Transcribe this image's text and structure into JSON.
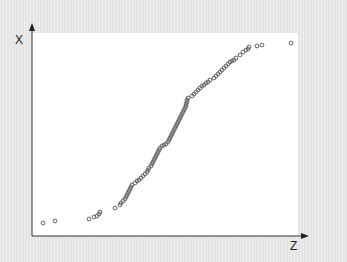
{
  "chart_data": {
    "type": "scatter",
    "title": "",
    "xlabel": "Z",
    "ylabel": "X",
    "grid": false,
    "legend": null,
    "marker": "open-circle",
    "points_px": [
      [
        43,
        223
      ],
      [
        55,
        221
      ],
      [
        89,
        219
      ],
      [
        94,
        217
      ],
      [
        97,
        216
      ],
      [
        99,
        214
      ],
      [
        100,
        212
      ],
      [
        115,
        208
      ],
      [
        120,
        205
      ],
      [
        121,
        203
      ],
      [
        123,
        201
      ],
      [
        125,
        199
      ],
      [
        126,
        197
      ],
      [
        127,
        195
      ],
      [
        128,
        193
      ],
      [
        129,
        191
      ],
      [
        130,
        189
      ],
      [
        131,
        187
      ],
      [
        132,
        185
      ],
      [
        135,
        183
      ],
      [
        137,
        181
      ],
      [
        139,
        180
      ],
      [
        141,
        178
      ],
      [
        143,
        176
      ],
      [
        145,
        174
      ],
      [
        147,
        172
      ],
      [
        148,
        170
      ],
      [
        149,
        168
      ],
      [
        151,
        166
      ],
      [
        152,
        164
      ],
      [
        153,
        162
      ],
      [
        154,
        160
      ],
      [
        155,
        158
      ],
      [
        156,
        156
      ],
      [
        157,
        154
      ],
      [
        158,
        152
      ],
      [
        159,
        150
      ],
      [
        160,
        148
      ],
      [
        162,
        146
      ],
      [
        164,
        145
      ],
      [
        166,
        144
      ],
      [
        168,
        142
      ],
      [
        169,
        140
      ],
      [
        170,
        138
      ],
      [
        171,
        136
      ],
      [
        172,
        134
      ],
      [
        173,
        132
      ],
      [
        174,
        130
      ],
      [
        175,
        128
      ],
      [
        176,
        126
      ],
      [
        177,
        124
      ],
      [
        178,
        122
      ],
      [
        179,
        120
      ],
      [
        180,
        118
      ],
      [
        181,
        116
      ],
      [
        182,
        114
      ],
      [
        183,
        112
      ],
      [
        184,
        110
      ],
      [
        185,
        108
      ],
      [
        186,
        106
      ],
      [
        186,
        104
      ],
      [
        187,
        102
      ],
      [
        187,
        100
      ],
      [
        188,
        98
      ],
      [
        192,
        96
      ],
      [
        194,
        94
      ],
      [
        196,
        92
      ],
      [
        198,
        90
      ],
      [
        200,
        88
      ],
      [
        202,
        86
      ],
      [
        204,
        85
      ],
      [
        206,
        83
      ],
      [
        208,
        82
      ],
      [
        210,
        80
      ],
      [
        214,
        78
      ],
      [
        216,
        76
      ],
      [
        218,
        74
      ],
      [
        220,
        72
      ],
      [
        222,
        70
      ],
      [
        224,
        68
      ],
      [
        226,
        66
      ],
      [
        228,
        64
      ],
      [
        230,
        62
      ],
      [
        232,
        61
      ],
      [
        234,
        60
      ],
      [
        236,
        58
      ],
      [
        240,
        55
      ],
      [
        243,
        52
      ],
      [
        246,
        50
      ],
      [
        248,
        49
      ],
      [
        249,
        47
      ],
      [
        257,
        46
      ],
      [
        262,
        45
      ],
      [
        291,
        43
      ]
    ],
    "plot_area_px": {
      "left": 32,
      "top": 33,
      "right": 298,
      "bottom": 236
    }
  },
  "axes": {
    "y_label": "X",
    "x_label": "Z"
  },
  "colors": {
    "background": "#e9e9e9",
    "plot_background": "#ffffff",
    "axis": "#333333",
    "marker": "#555555"
  }
}
